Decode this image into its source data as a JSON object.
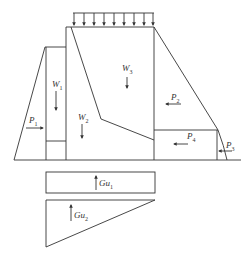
{
  "diagram": {
    "stroke_color": "#333333",
    "background": "#ffffff",
    "labels": {
      "W1": {
        "main": "W",
        "sub": "1"
      },
      "W2": {
        "main": "W",
        "sub": "2"
      },
      "W3": {
        "main": "W",
        "sub": "3"
      },
      "P1": {
        "main": "P",
        "sub": "1"
      },
      "P2": {
        "main": "P",
        "sub": "2"
      },
      "P3": {
        "main": "P",
        "sub": "3"
      },
      "P4": {
        "main": "P",
        "sub": "4"
      },
      "Gu1": {
        "main": "Gu",
        "sub": "1"
      },
      "Gu2": {
        "main": "Gu",
        "sub": "2"
      }
    },
    "top_load_arrow_count": 9
  }
}
